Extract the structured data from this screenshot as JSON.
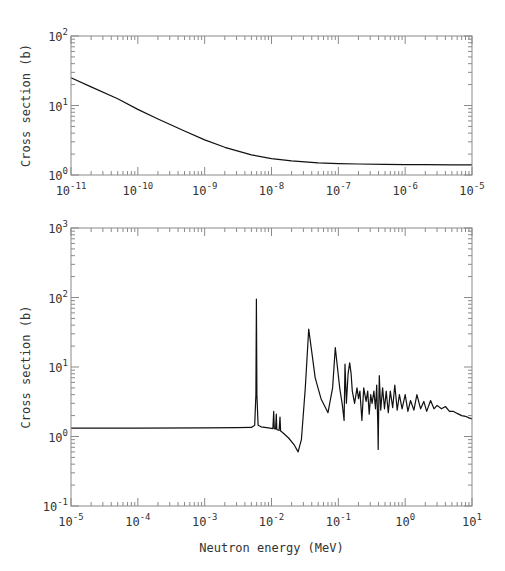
{
  "chart_data": [
    {
      "type": "line",
      "panel": "top",
      "title": "",
      "xlabel": "",
      "ylabel": "Cross section (b)",
      "xscale": "log",
      "yscale": "log",
      "xlim": [
        1e-11,
        1e-05
      ],
      "ylim": [
        1,
        100
      ],
      "x_tick_labels": [
        "10^-11",
        "10^-10",
        "10^-9",
        "10^-8",
        "10^-7",
        "10^-6",
        "10^-5"
      ],
      "y_tick_labels": [
        "10^0",
        "10^1",
        "10^2"
      ],
      "grid": false,
      "legend": null,
      "series": [
        {
          "name": "cross section (thermal region)",
          "x": [
            1e-11,
            2e-11,
            5e-11,
            1e-10,
            2e-10,
            5e-10,
            1e-09,
            2e-09,
            5e-09,
            1e-08,
            2e-08,
            5e-08,
            1e-07,
            2e-07,
            5e-07,
            1e-06,
            2e-06,
            5e-06,
            1e-05
          ],
          "y": [
            25,
            18.5,
            12.5,
            8.8,
            6.4,
            4.3,
            3.2,
            2.5,
            1.95,
            1.72,
            1.6,
            1.5,
            1.46,
            1.44,
            1.42,
            1.41,
            1.41,
            1.4,
            1.4
          ]
        }
      ]
    },
    {
      "type": "line",
      "panel": "bottom",
      "title": "",
      "xlabel": "Neutron energy (MeV)",
      "ylabel": "Cross section (b)",
      "xscale": "log",
      "yscale": "log",
      "xlim": [
        1e-05,
        10
      ],
      "ylim": [
        0.1,
        1000
      ],
      "x_tick_labels": [
        "10^-5",
        "10^-4",
        "10^-3",
        "10^-2",
        "10^-1",
        "10^0",
        "10^1"
      ],
      "y_tick_labels": [
        "10^-1",
        "10^0",
        "10^1",
        "10^2",
        "10^3"
      ],
      "grid": false,
      "legend": null,
      "annotations": [],
      "series": [
        {
          "name": "cross section (resonance region)",
          "x": [
            1e-05,
            0.0001,
            0.001,
            0.003,
            0.005,
            0.0056,
            0.00585,
            0.00595,
            0.00605,
            0.0063,
            0.007,
            0.009,
            0.0105,
            0.0108,
            0.011,
            0.0115,
            0.0118,
            0.012,
            0.013,
            0.0134,
            0.0137,
            0.0145,
            0.018,
            0.022,
            0.025,
            0.028,
            0.032,
            0.036,
            0.039,
            0.045,
            0.055,
            0.07,
            0.082,
            0.09,
            0.095,
            0.105,
            0.115,
            0.122,
            0.126,
            0.132,
            0.14,
            0.148,
            0.155,
            0.162,
            0.175,
            0.19,
            0.2,
            0.21,
            0.225,
            0.24,
            0.26,
            0.275,
            0.29,
            0.305,
            0.32,
            0.34,
            0.36,
            0.375,
            0.39,
            0.395,
            0.4,
            0.41,
            0.43,
            0.46,
            0.49,
            0.52,
            0.56,
            0.6,
            0.65,
            0.7,
            0.76,
            0.82,
            0.9,
            1.0,
            1.1,
            1.2,
            1.35,
            1.5,
            1.7,
            1.9,
            2.1,
            2.4,
            2.7,
            3.0,
            3.5,
            4.0,
            4.6,
            5.3,
            6.0,
            7.0,
            8.0,
            9.0,
            10.0
          ],
          "y": [
            1.32,
            1.32,
            1.33,
            1.34,
            1.35,
            1.45,
            4.0,
            95,
            4.0,
            1.45,
            1.38,
            1.33,
            1.3,
            2.3,
            1.3,
            1.28,
            2.1,
            1.26,
            1.22,
            1.9,
            1.2,
            1.15,
            0.95,
            0.75,
            0.6,
            0.9,
            5.0,
            35,
            20,
            7.0,
            3.5,
            2.2,
            5.0,
            19,
            12,
            5.0,
            2.8,
            1.7,
            11,
            3.0,
            8.0,
            11.5,
            8.0,
            4.5,
            3.0,
            5.0,
            3.5,
            4.5,
            1.7,
            5.0,
            3.2,
            4.5,
            2.1,
            4.0,
            3.0,
            4.5,
            2.5,
            5.5,
            1.5,
            0.65,
            2.0,
            7.5,
            2.4,
            5.0,
            2.5,
            4.5,
            2.2,
            4.5,
            2.6,
            5.5,
            2.4,
            4.0,
            2.5,
            4.0,
            2.3,
            3.3,
            2.4,
            4.0,
            2.5,
            3.2,
            2.3,
            3.3,
            2.5,
            2.8,
            2.5,
            2.7,
            2.3,
            2.3,
            2.15,
            2.0,
            1.95,
            1.85,
            1.8
          ]
        }
      ]
    }
  ],
  "labels": {
    "top_ylabel": "Cross section (b)",
    "bottom_ylabel": "Cross section (b)",
    "bottom_xlabel": "Neutron energy (MeV)"
  },
  "colors": {
    "curve": "#111111",
    "axis": "#8a8a8a",
    "text": "#333333",
    "background": "#ffffff"
  }
}
